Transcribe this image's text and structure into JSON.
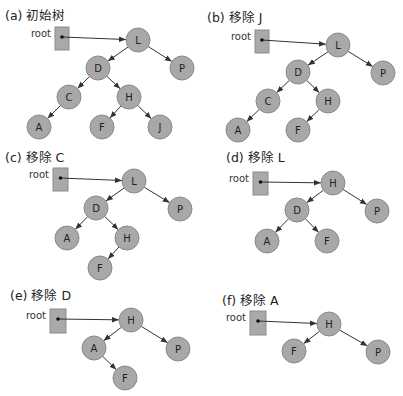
{
  "panels": [
    {
      "title": "(a) 初始树",
      "root_label": "root",
      "title_pos": [
        5,
        20
      ],
      "root_box": [
        55,
        27,
        14,
        23
      ],
      "nodes": [
        {
          "id": "L",
          "x": 138,
          "y": 40
        },
        {
          "id": "P",
          "x": 182,
          "y": 68
        },
        {
          "id": "D",
          "x": 98,
          "y": 68
        },
        {
          "id": "C",
          "x": 69,
          "y": 97
        },
        {
          "id": "H",
          "x": 129,
          "y": 97
        },
        {
          "id": "A",
          "x": 39,
          "y": 127
        },
        {
          "id": "F",
          "x": 102,
          "y": 127
        },
        {
          "id": "J",
          "x": 160,
          "y": 127
        }
      ],
      "edges": [
        [
          "root",
          "L"
        ],
        [
          "L",
          "D"
        ],
        [
          "L",
          "P"
        ],
        [
          "D",
          "C"
        ],
        [
          "D",
          "H"
        ],
        [
          "C",
          "A"
        ],
        [
          "H",
          "F"
        ],
        [
          "H",
          "J"
        ]
      ]
    },
    {
      "title": "(b) 移除 J",
      "root_label": "root",
      "title_pos": [
        207,
        22
      ],
      "root_box": [
        255,
        30,
        14,
        23
      ],
      "nodes": [
        {
          "id": "L",
          "x": 338,
          "y": 45
        },
        {
          "id": "P",
          "x": 383,
          "y": 73
        },
        {
          "id": "D",
          "x": 298,
          "y": 72
        },
        {
          "id": "C",
          "x": 268,
          "y": 101
        },
        {
          "id": "H",
          "x": 328,
          "y": 101
        },
        {
          "id": "A",
          "x": 238,
          "y": 130
        },
        {
          "id": "F",
          "x": 298,
          "y": 130
        }
      ],
      "edges": [
        [
          "root",
          "L"
        ],
        [
          "L",
          "D"
        ],
        [
          "L",
          "P"
        ],
        [
          "D",
          "C"
        ],
        [
          "D",
          "H"
        ],
        [
          "C",
          "A"
        ],
        [
          "H",
          "F"
        ]
      ]
    },
    {
      "title": "(c) 移除 C",
      "root_label": "root",
      "title_pos": [
        5,
        162
      ],
      "root_box": [
        53,
        168,
        15,
        23
      ],
      "nodes": [
        {
          "id": "L",
          "x": 134,
          "y": 181
        },
        {
          "id": "P",
          "x": 180,
          "y": 209
        },
        {
          "id": "D",
          "x": 96,
          "y": 208
        },
        {
          "id": "A",
          "x": 67,
          "y": 238
        },
        {
          "id": "H",
          "x": 127,
          "y": 238
        },
        {
          "id": "F",
          "x": 100,
          "y": 268
        }
      ],
      "edges": [
        [
          "root",
          "L"
        ],
        [
          "L",
          "D"
        ],
        [
          "L",
          "P"
        ],
        [
          "D",
          "A"
        ],
        [
          "D",
          "H"
        ],
        [
          "H",
          "F"
        ]
      ]
    },
    {
      "title": "(d) 移除 L",
      "root_label": "root",
      "title_pos": [
        226,
        162
      ],
      "root_box": [
        253,
        172,
        15,
        23
      ],
      "nodes": [
        {
          "id": "H",
          "x": 333,
          "y": 183
        },
        {
          "id": "D",
          "x": 297,
          "y": 210
        },
        {
          "id": "P",
          "x": 377,
          "y": 211
        },
        {
          "id": "A",
          "x": 267,
          "y": 241
        },
        {
          "id": "F",
          "x": 327,
          "y": 241
        }
      ],
      "edges": [
        [
          "root",
          "H"
        ],
        [
          "H",
          "D"
        ],
        [
          "H",
          "P"
        ],
        [
          "D",
          "A"
        ],
        [
          "D",
          "F"
        ]
      ]
    },
    {
      "title": "(e) 移除 D",
      "root_label": "root",
      "title_pos": [
        10,
        300
      ],
      "root_box": [
        50,
        309,
        16,
        24
      ],
      "nodes": [
        {
          "id": "H",
          "x": 131,
          "y": 320
        },
        {
          "id": "A",
          "x": 94,
          "y": 348
        },
        {
          "id": "P",
          "x": 178,
          "y": 349
        },
        {
          "id": "F",
          "x": 125,
          "y": 378
        }
      ],
      "edges": [
        [
          "root",
          "H"
        ],
        [
          "H",
          "A"
        ],
        [
          "H",
          "P"
        ],
        [
          "A",
          "F"
        ]
      ]
    },
    {
      "title": "(f) 移除 A",
      "root_label": "root",
      "title_pos": [
        222,
        305
      ],
      "root_box": [
        250,
        311,
        16,
        24
      ],
      "nodes": [
        {
          "id": "H",
          "x": 329,
          "y": 324
        },
        {
          "id": "F",
          "x": 294,
          "y": 351
        },
        {
          "id": "P",
          "x": 378,
          "y": 352
        }
      ],
      "edges": [
        [
          "root",
          "H"
        ],
        [
          "H",
          "F"
        ],
        [
          "H",
          "P"
        ]
      ]
    }
  ],
  "style": {
    "node_fill": "#a8a8a8",
    "node_stroke": "#8a8a8a",
    "root_box_fill": "#a9a9a9",
    "edge_color": "#333333",
    "node_radius": 12
  }
}
